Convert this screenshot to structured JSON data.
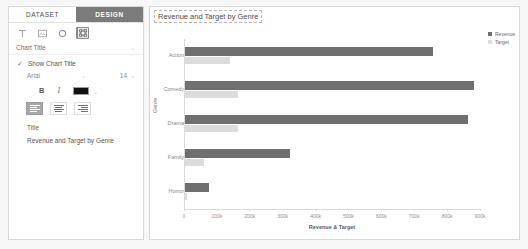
{
  "panel": {
    "tabs": [
      {
        "label": "DATASET",
        "active": false
      },
      {
        "label": "DESIGN",
        "active": true
      }
    ],
    "toolbar_icons": [
      {
        "name": "text-icon",
        "selected": false
      },
      {
        "name": "image-icon",
        "selected": false
      },
      {
        "name": "circle-icon",
        "selected": false
      },
      {
        "name": "settings-icon",
        "selected": true
      }
    ],
    "section": {
      "label": "Chart Title",
      "caret": "⌄"
    },
    "show_chart_title": {
      "label": "Show Chart Title",
      "checked": true,
      "check_glyph": "✓"
    },
    "font": {
      "family": "Arial",
      "size": "14",
      "dropdown_glyph": "⌄"
    },
    "style": {
      "bold": "B",
      "italic": "I",
      "color": "#111111"
    },
    "align": {
      "options": [
        "left",
        "center",
        "right"
      ],
      "selected": "left"
    },
    "title_field": {
      "label": "Title",
      "value": "Revenue and Target by Genre"
    }
  },
  "chart_data": {
    "type": "bar",
    "orientation": "horizontal",
    "title": "Revenue and Target by Genre",
    "xlabel": "Revenue & Target",
    "ylabel": "Genre",
    "categories": [
      "Action",
      "Comedy",
      "Drama",
      "Family",
      "Horror"
    ],
    "series": [
      {
        "name": "Revenue",
        "color": "#6f6f6f",
        "values": [
          755000,
          880000,
          860000,
          320000,
          73000
        ]
      },
      {
        "name": "Target",
        "color": "#dcdcdc",
        "values": [
          137000,
          161000,
          161000,
          58000,
          6000
        ]
      }
    ],
    "xlim": [
      0,
      900000
    ],
    "xticks": [
      0,
      100000,
      200000,
      300000,
      400000,
      500000,
      600000,
      700000,
      800000,
      900000
    ],
    "xticklabels": [
      "0",
      "100k",
      "200k",
      "300k",
      "400k",
      "500k",
      "600k",
      "700k",
      "800k",
      "900k"
    ],
    "grid": false,
    "legend_position": "top-right"
  }
}
